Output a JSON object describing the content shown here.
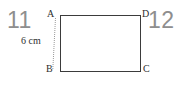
{
  "figure": {
    "shape_name": "rectangle",
    "vertices": [
      {
        "id": "a",
        "label": "A",
        "position": "top-left"
      },
      {
        "id": "d",
        "label": "D",
        "position": "top-right"
      },
      {
        "id": "b",
        "label": "B",
        "position": "bottom-left"
      },
      {
        "id": "c",
        "label": "C",
        "position": "bottom-right"
      }
    ],
    "dimension": {
      "label": "6 cm",
      "value": 6,
      "unit": "cm",
      "side": "AB"
    },
    "stroke_color": "#3b3b3b",
    "leader_line_color": "#9a9a9a"
  },
  "page_numbers": {
    "left": "11",
    "right": "12",
    "color": "#8e8e8e"
  },
  "background_color": "#ffffff"
}
